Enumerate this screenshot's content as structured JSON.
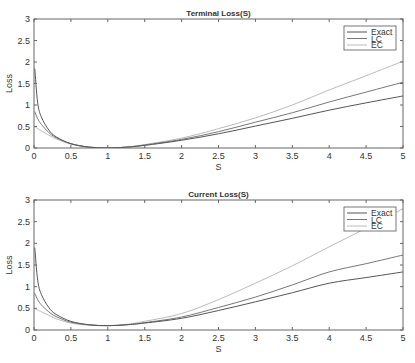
{
  "chart_data": [
    {
      "type": "line",
      "title": "Terminal Loss(S)",
      "xlabel": "S",
      "ylabel": "Loss",
      "xlim": [
        0,
        5
      ],
      "ylim": [
        0,
        3
      ],
      "xticks": [
        "0",
        "0.5",
        "1",
        "1.5",
        "2",
        "2.5",
        "3",
        "3.5",
        "4",
        "4.5",
        "5"
      ],
      "yticks": [
        "0",
        "0.5",
        "1",
        "1.5",
        "2",
        "2.5",
        "3"
      ],
      "grid": false,
      "legend_position": "upper right",
      "x": [
        0.01,
        0.05,
        0.1,
        0.2,
        0.3,
        0.5,
        0.75,
        1.0,
        1.25,
        1.5,
        2.0,
        2.5,
        3.0,
        3.5,
        4.0,
        4.5,
        5.0
      ],
      "series": [
        {
          "name": "Exact",
          "color": "#555555",
          "values": [
            1.85,
            1.05,
            0.72,
            0.42,
            0.26,
            0.1,
            0.02,
            0.0,
            0.02,
            0.06,
            0.18,
            0.33,
            0.51,
            0.69,
            0.88,
            1.05,
            1.21
          ]
        },
        {
          "name": "LC",
          "color": "#777777",
          "values": [
            0.85,
            0.68,
            0.55,
            0.36,
            0.24,
            0.1,
            0.02,
            0.0,
            0.02,
            0.07,
            0.2,
            0.38,
            0.6,
            0.82,
            1.07,
            1.3,
            1.53
          ]
        },
        {
          "name": "EC",
          "color": "#bbbbbb",
          "values": [
            0.5,
            0.45,
            0.4,
            0.3,
            0.21,
            0.09,
            0.02,
            0.0,
            0.02,
            0.08,
            0.23,
            0.45,
            0.7,
            1.0,
            1.35,
            1.68,
            2.02
          ]
        }
      ]
    },
    {
      "type": "line",
      "title": "Current Loss(S)",
      "xlabel": "S",
      "ylabel": "Loss",
      "xlim": [
        0,
        5
      ],
      "ylim": [
        0,
        3
      ],
      "xticks": [
        "0",
        "0.5",
        "1",
        "1.5",
        "2",
        "2.5",
        "3",
        "3.5",
        "4",
        "4.5",
        "5"
      ],
      "yticks": [
        "0",
        "0.5",
        "1",
        "1.5",
        "2",
        "2.5",
        "3"
      ],
      "grid": false,
      "legend_position": "upper right",
      "x": [
        0.01,
        0.05,
        0.1,
        0.2,
        0.3,
        0.5,
        0.75,
        1.0,
        1.25,
        1.5,
        2.0,
        2.5,
        3.0,
        3.5,
        4.0,
        4.5,
        5.0
      ],
      "series": [
        {
          "name": "Exact",
          "color": "#555555",
          "values": [
            1.9,
            1.15,
            0.82,
            0.52,
            0.36,
            0.2,
            0.12,
            0.1,
            0.12,
            0.16,
            0.27,
            0.45,
            0.65,
            0.86,
            1.08,
            1.21,
            1.34
          ]
        },
        {
          "name": "LC",
          "color": "#777777",
          "values": [
            0.85,
            0.7,
            0.58,
            0.42,
            0.31,
            0.18,
            0.12,
            0.1,
            0.12,
            0.17,
            0.3,
            0.52,
            0.76,
            1.04,
            1.34,
            1.53,
            1.73
          ]
        },
        {
          "name": "EC",
          "color": "#bbbbbb",
          "values": [
            0.5,
            0.46,
            0.42,
            0.34,
            0.26,
            0.16,
            0.11,
            0.1,
            0.13,
            0.2,
            0.38,
            0.7,
            1.08,
            1.48,
            1.92,
            2.35,
            2.8
          ]
        }
      ]
    }
  ]
}
